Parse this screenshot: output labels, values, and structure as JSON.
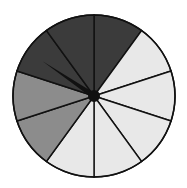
{
  "spinner": {
    "sections": 10,
    "center": [
      94,
      96
    ],
    "radius": 81,
    "colors": {
      "dark": "#3b3b3b",
      "medium": "#8c8c8c",
      "light": "#e8e8e8",
      "outline": "#111111"
    },
    "section_shades": [
      "dark",
      "light",
      "light",
      "light",
      "light",
      "light",
      "medium",
      "medium",
      "dark",
      "dark"
    ],
    "pointer_angle_deg": -56
  }
}
